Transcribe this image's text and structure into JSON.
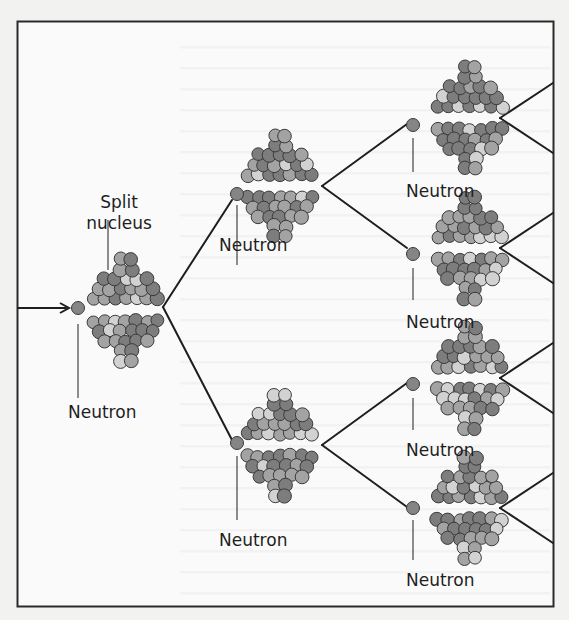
{
  "diagram": {
    "type": "nuclear-chain-reaction",
    "colors": {
      "frame": "#2a2a2a",
      "line": "#1e1e1e",
      "background": "#fafafa",
      "page": "#f2f2f1",
      "particle_dark": "#7d7d7d",
      "particle_mid": "#a3a3a3",
      "particle_light": "#d2d2d2",
      "particle_outline": "#3a3a3a",
      "neutron": "#858585"
    },
    "labels": {
      "split_nucleus": "Split nucleus",
      "neutron_gen1": "Neutron",
      "neutron_gen2_top": "Neutron",
      "neutron_gen2_bottom": "Neutron",
      "neutron_gen3_1": "Neutron",
      "neutron_gen3_2": "Neutron",
      "neutron_gen3_3": "Neutron",
      "neutron_gen3_4": "Neutron"
    },
    "generations": [
      {
        "level": 1,
        "nuclei": 1
      },
      {
        "level": 2,
        "nuclei": 2
      },
      {
        "level": 3,
        "nuclei": 4
      }
    ],
    "incoming": "arrow"
  }
}
